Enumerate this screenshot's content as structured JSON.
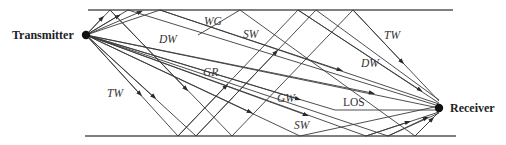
{
  "diagram": {
    "nodes": {
      "transmitter": {
        "label": "Transmitter",
        "x": 86,
        "y": 35
      },
      "receiver": {
        "label": "Receiver",
        "x": 439,
        "y": 108
      }
    },
    "boundaries": {
      "top": {
        "x1": 88,
        "x2": 453,
        "y": 10
      },
      "bottom": {
        "x1": 85,
        "x2": 456,
        "y": 136
      }
    },
    "labels": {
      "WG": "WG",
      "DW_left": "DW",
      "SW_top": "SW",
      "GR": "GR",
      "TW_left": "TW",
      "GW": "GW",
      "LOS": "LOS",
      "SW_bottom": "SW",
      "TW_right": "TW",
      "DW_right": "DW"
    },
    "ray_color": "#3a3a3a",
    "wall_color": "#555555"
  }
}
